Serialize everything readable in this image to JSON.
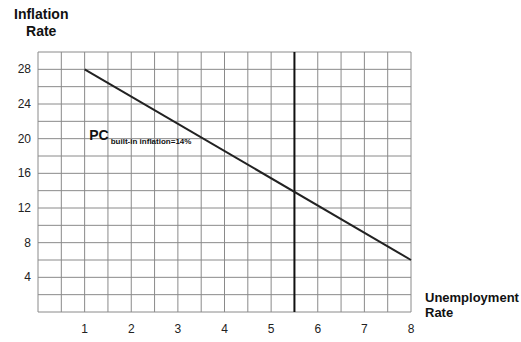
{
  "chart_data": {
    "type": "line",
    "title": "",
    "xlabel": "Unemployment Rate",
    "ylabel": "Inflation Rate",
    "xlabel_lines": [
      "Unemployment",
      "Rate"
    ],
    "ylabel_lines": [
      "Inflation",
      "Rate"
    ],
    "xlim": [
      0,
      8
    ],
    "ylim": [
      0,
      30
    ],
    "x_ticks": [
      1,
      2,
      3,
      4,
      5,
      6,
      7,
      8
    ],
    "y_ticks": [
      4,
      8,
      12,
      16,
      20,
      24,
      28
    ],
    "grid": true,
    "grid_x_step": 0.5,
    "grid_y_step": 2,
    "series": [
      {
        "name": "PC built-in inflation=14%",
        "x": [
          1,
          8
        ],
        "y": [
          28,
          6
        ],
        "color": "#222222"
      }
    ],
    "vertical_lines": [
      {
        "x": 5.5,
        "color": "#111111"
      }
    ],
    "annotations": [
      {
        "text": "PC",
        "subscript": "built-in inflation=14%",
        "x": 1.1,
        "y": 20.6
      }
    ]
  }
}
